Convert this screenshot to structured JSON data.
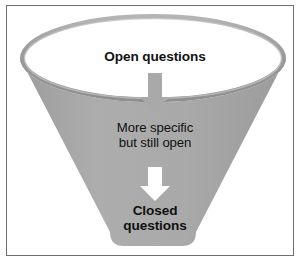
{
  "diagram": {
    "frame": {
      "border_color": "#6e6e6e",
      "background": "#ffffff"
    },
    "funnel": {
      "body_color": "#a9a9a9",
      "rim_color": "#9a9a9a",
      "rim_highlight_color": "#c2c2c2",
      "rim_shadow_color": "#8d8d8d",
      "interior_color": "#ffffff"
    },
    "labels": {
      "top": "Open questions",
      "middle": "More specific\nbut still open",
      "bottom": "Closed\nquestions"
    },
    "arrows": [
      {
        "name": "arrow-open-to-middle",
        "direction": "down",
        "color": "#a9a9a9"
      },
      {
        "name": "arrow-middle-to-closed",
        "direction": "down",
        "color": "#ffffff"
      }
    ]
  }
}
